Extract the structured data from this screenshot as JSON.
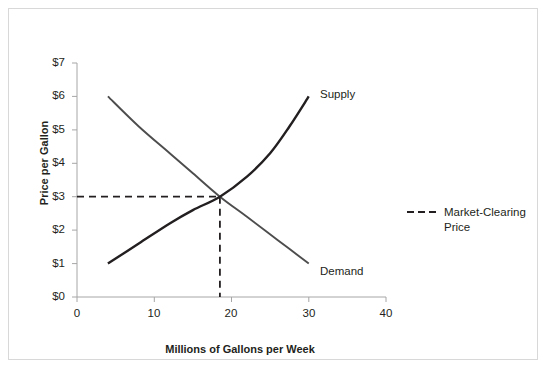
{
  "chart_data": {
    "type": "line",
    "title": "",
    "xlabel": "Millions of Gallons per Week",
    "ylabel": "Price per Gallon",
    "xlim": [
      0,
      40
    ],
    "ylim": [
      0,
      7
    ],
    "xticks": [
      "0",
      "10",
      "20",
      "30",
      "40"
    ],
    "xtick_values": [
      0,
      10,
      20,
      30,
      40
    ],
    "yticks": [
      "$0",
      "$1",
      "$2",
      "$3",
      "$4",
      "$5",
      "$6",
      "$7"
    ],
    "ytick_values": [
      0,
      1,
      2,
      3,
      4,
      5,
      6,
      7
    ],
    "grid": false,
    "legend_position": "right",
    "series": [
      {
        "name": "Supply",
        "label": "Supply",
        "color": "#231f20",
        "style": "solid",
        "points": [
          [
            4,
            1.0
          ],
          [
            8,
            1.6
          ],
          [
            12,
            2.2
          ],
          [
            15,
            2.6
          ],
          [
            18.5,
            3.0
          ],
          [
            22,
            3.6
          ],
          [
            25,
            4.3
          ],
          [
            27.5,
            5.1
          ],
          [
            30,
            6.0
          ]
        ]
      },
      {
        "name": "Demand",
        "label": "Demand",
        "color": "#231f20",
        "style": "solid",
        "points": [
          [
            4,
            6.0
          ],
          [
            8,
            5.1
          ],
          [
            12,
            4.3
          ],
          [
            15,
            3.7
          ],
          [
            18.5,
            3.0
          ],
          [
            22,
            2.4
          ],
          [
            26,
            1.7
          ],
          [
            30,
            1.0
          ]
        ]
      }
    ],
    "annotations": [
      {
        "name": "market-clearing-price",
        "style": "dashed",
        "color": "#231f20",
        "horizontal": {
          "y": 3,
          "x_from": 0,
          "x_to": 18.5
        },
        "vertical": {
          "x": 18.5,
          "y_from": 0,
          "y_to": 3
        }
      }
    ],
    "equilibrium": {
      "quantity": 18.5,
      "price": 3
    }
  },
  "legend": {
    "entries": [
      {
        "label_line1": "Market-Clearing",
        "label_line2": "Price",
        "style": "dashed",
        "color": "#231f20"
      }
    ]
  }
}
